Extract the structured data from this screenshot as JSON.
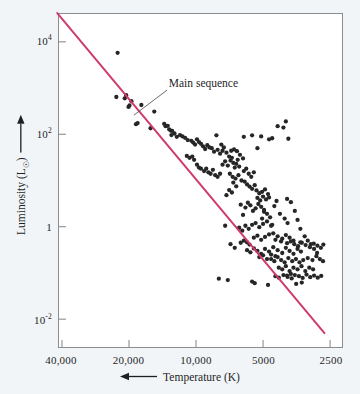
{
  "figure": {
    "background_color": "#f1f5f8",
    "plot_background_color": "#ffffff",
    "frame_color": "#8a8d90"
  },
  "chart_data": {
    "type": "scatter",
    "title": "",
    "xlabel": "Temperature (K)",
    "ylabel": "Luminosity (L☉)",
    "x_scale": "log-reversed",
    "y_scale": "log",
    "xlim": [
      40000,
      2500
    ],
    "ylim": [
      0.0025,
      40000
    ],
    "grid": false,
    "legend": null,
    "xticks": [
      40000,
      20000,
      10000,
      5000,
      2500
    ],
    "xtick_labels": [
      "40,000",
      "20,000",
      "10,000",
      "5000",
      "2500"
    ],
    "yticks": [
      10000,
      100,
      1,
      0.01
    ],
    "ytick_labels_html": [
      "10<sup>4</sup>",
      "10<sup>2</sup>",
      "1",
      "10<sup>-2</sup>"
    ],
    "annotations": [
      {
        "text": "Main sequence",
        "x": 13500,
        "y": 900,
        "leader_to_x": 19000,
        "leader_to_y": 260
      }
    ],
    "series": [
      {
        "name": "main-sequence-fit-line",
        "type": "line",
        "color": "#cf3a6b",
        "linewidth": 2.0,
        "points": [
          [
            42000,
            42000
          ],
          [
            2650,
            0.005
          ]
        ]
      },
      {
        "name": "stars",
        "type": "scatter",
        "color": "#262626",
        "marker": "o",
        "marker_size": 3.4,
        "count": 236,
        "points": [
          [
            22500,
            5800
          ],
          [
            22800,
            640
          ],
          [
            20600,
            700
          ],
          [
            20900,
            600
          ],
          [
            20100,
            390
          ],
          [
            19900,
            420
          ],
          [
            19500,
            520
          ],
          [
            18600,
            165
          ],
          [
            18300,
            175
          ],
          [
            17600,
            430
          ],
          [
            16000,
            135
          ],
          [
            15400,
            310
          ],
          [
            13900,
            168
          ],
          [
            13700,
            150
          ],
          [
            13400,
            152
          ],
          [
            13200,
            128
          ],
          [
            13000,
            120
          ],
          [
            12800,
            118
          ],
          [
            12500,
            104
          ],
          [
            12900,
            96
          ],
          [
            11000,
            34
          ],
          [
            10700,
            31
          ],
          [
            10400,
            33
          ],
          [
            10200,
            28
          ],
          [
            9900,
            22
          ],
          [
            9700,
            19
          ],
          [
            9500,
            18
          ],
          [
            9200,
            16
          ],
          [
            9000,
            18
          ],
          [
            8800,
            15
          ],
          [
            8600,
            14
          ],
          [
            8400,
            17
          ],
          [
            8200,
            13
          ],
          [
            8000,
            12
          ],
          [
            7800,
            14
          ],
          [
            8100,
            95
          ],
          [
            7700,
            60
          ],
          [
            7500,
            52
          ],
          [
            7300,
            40
          ],
          [
            7100,
            33
          ],
          [
            7600,
            22
          ],
          [
            7400,
            26
          ],
          [
            7200,
            21
          ],
          [
            7000,
            27
          ],
          [
            6900,
            31
          ],
          [
            6800,
            24
          ],
          [
            6700,
            19
          ],
          [
            6600,
            23
          ],
          [
            6500,
            28
          ],
          [
            6400,
            20
          ],
          [
            6950,
            44
          ],
          [
            6750,
            47
          ],
          [
            6550,
            43
          ],
          [
            6350,
            36
          ],
          [
            6150,
            30
          ],
          [
            7050,
            14
          ],
          [
            6850,
            12
          ],
          [
            6650,
            11
          ],
          [
            6450,
            13
          ],
          [
            6250,
            10
          ],
          [
            6100,
            16
          ],
          [
            5950,
            18
          ],
          [
            5800,
            14
          ],
          [
            5650,
            12
          ],
          [
            5500,
            15
          ],
          [
            6050,
            9.5
          ],
          [
            5900,
            8.2
          ],
          [
            5750,
            7.4
          ],
          [
            5600,
            6.6
          ],
          [
            5450,
            7.9
          ],
          [
            6300,
            3.0
          ],
          [
            6150,
            1.8
          ],
          [
            6000,
            2.6
          ],
          [
            5850,
            3.3
          ],
          [
            5700,
            2.9
          ],
          [
            5550,
            2.2
          ],
          [
            5400,
            2.5
          ],
          [
            5250,
            3.1
          ],
          [
            5100,
            2.7
          ],
          [
            4950,
            2.3
          ],
          [
            5350,
            6.1
          ],
          [
            5200,
            5.3
          ],
          [
            5050,
            5.7
          ],
          [
            4900,
            6.4
          ],
          [
            4750,
            5.1
          ],
          [
            5300,
            4.2
          ],
          [
            5150,
            3.7
          ],
          [
            5000,
            4.5
          ],
          [
            4850,
            3.9
          ],
          [
            4700,
            4.3
          ],
          [
            6400,
            0.95
          ],
          [
            6200,
            0.82
          ],
          [
            6000,
            1.05
          ],
          [
            5800,
            0.9
          ],
          [
            5600,
            1.1
          ],
          [
            5400,
            1.2
          ],
          [
            5200,
            0.98
          ],
          [
            5000,
            1.15
          ],
          [
            4800,
            1.3
          ],
          [
            4600,
            1.05
          ],
          [
            5500,
            0.58
          ],
          [
            5300,
            0.64
          ],
          [
            5100,
            0.52
          ],
          [
            4900,
            0.6
          ],
          [
            4700,
            0.68
          ],
          [
            4500,
            0.72
          ],
          [
            4300,
            0.62
          ],
          [
            4100,
            0.55
          ],
          [
            3950,
            0.66
          ],
          [
            3800,
            0.58
          ],
          [
            5900,
            0.31
          ],
          [
            5700,
            0.28
          ],
          [
            5500,
            0.34
          ],
          [
            5300,
            0.3
          ],
          [
            5100,
            0.26
          ],
          [
            4900,
            0.33
          ],
          [
            4700,
            0.29
          ],
          [
            4500,
            0.36
          ],
          [
            4300,
            0.31
          ],
          [
            4100,
            0.27
          ],
          [
            3950,
            0.35
          ],
          [
            3800,
            0.3
          ],
          [
            3650,
            0.26
          ],
          [
            3500,
            0.33
          ],
          [
            3380,
            0.29
          ],
          [
            4600,
            0.2
          ],
          [
            4450,
            0.18
          ],
          [
            4300,
            0.22
          ],
          [
            4150,
            0.19
          ],
          [
            4000,
            0.17
          ],
          [
            3850,
            0.21
          ],
          [
            3700,
            0.18
          ],
          [
            3560,
            0.2
          ],
          [
            3430,
            0.17
          ],
          [
            3300,
            0.19
          ],
          [
            4250,
            0.13
          ],
          [
            4100,
            0.12
          ],
          [
            3950,
            0.14
          ],
          [
            3800,
            0.11
          ],
          [
            3650,
            0.13
          ],
          [
            3500,
            0.12
          ],
          [
            3360,
            0.14
          ],
          [
            3230,
            0.11
          ],
          [
            3100,
            0.13
          ],
          [
            2980,
            0.12
          ],
          [
            3450,
            0.085
          ],
          [
            3320,
            0.078
          ],
          [
            3190,
            0.092
          ],
          [
            3070,
            0.081
          ],
          [
            2950,
            0.088
          ],
          [
            2840,
            0.079
          ],
          [
            2740,
            0.086
          ],
          [
            3600,
            0.09
          ],
          [
            3750,
            0.095
          ],
          [
            3900,
            0.088
          ],
          [
            4400,
            0.085
          ],
          [
            4250,
            0.079
          ],
          [
            4050,
            0.09
          ],
          [
            3880,
            0.082
          ],
          [
            3720,
            0.076
          ],
          [
            7400,
            1.05
          ],
          [
            7000,
            0.42
          ],
          [
            6700,
            0.35
          ],
          [
            7900,
            0.075
          ],
          [
            7200,
            0.07
          ],
          [
            5600,
            0.065
          ],
          [
            6300,
            0.45
          ],
          [
            6100,
            0.5
          ],
          [
            5900,
            0.46
          ],
          [
            5750,
            0.41
          ],
          [
            3900,
            4.0
          ],
          [
            3750,
            3.4
          ],
          [
            3600,
            2.2
          ],
          [
            3500,
            1.4
          ],
          [
            3400,
            0.9
          ],
          [
            3250,
            0.62
          ],
          [
            3150,
            0.5
          ],
          [
            3050,
            0.42
          ],
          [
            2950,
            0.33
          ],
          [
            2860,
            0.27
          ],
          [
            4550,
            82
          ],
          [
            4300,
            150
          ],
          [
            4050,
            140
          ],
          [
            3950,
            190
          ],
          [
            3850,
            80
          ],
          [
            4700,
            78
          ],
          [
            5100,
            90
          ],
          [
            5600,
            95
          ],
          [
            6100,
            88
          ],
          [
            5300,
            50
          ],
          [
            4450,
            2.8
          ],
          [
            4350,
            3.6
          ],
          [
            4200,
            1.9
          ],
          [
            4000,
            1.5
          ],
          [
            3880,
            1.2
          ],
          [
            4650,
            1.6
          ],
          [
            4800,
            1.9
          ],
          [
            4950,
            2.1
          ],
          [
            5050,
            1.5
          ],
          [
            4550,
            1.1
          ],
          [
            3750,
            0.48
          ],
          [
            3620,
            0.42
          ],
          [
            3480,
            0.38
          ],
          [
            3350,
            0.45
          ],
          [
            3220,
            0.4
          ],
          [
            3080,
            0.36
          ],
          [
            2960,
            0.43
          ],
          [
            2850,
            0.39
          ],
          [
            2750,
            0.35
          ],
          [
            2680,
            0.41
          ],
          [
            6800,
            9.0
          ],
          [
            6600,
            7.5
          ],
          [
            6900,
            5.5
          ],
          [
            7100,
            6.2
          ],
          [
            7300,
            4.8
          ],
          [
            8300,
            42
          ],
          [
            8500,
            50
          ],
          [
            8000,
            46
          ],
          [
            7800,
            38
          ],
          [
            7600,
            44
          ],
          [
            9300,
            55
          ],
          [
            9100,
            48
          ],
          [
            8900,
            58
          ],
          [
            8700,
            52
          ],
          [
            9500,
            62
          ],
          [
            10500,
            72
          ],
          [
            10300,
            66
          ],
          [
            10100,
            60
          ],
          [
            9900,
            78
          ],
          [
            9700,
            68
          ],
          [
            11500,
            90
          ],
          [
            11200,
            84
          ],
          [
            10900,
            75
          ],
          [
            11800,
            96
          ],
          [
            12200,
            88
          ],
          [
            4400,
            0.52
          ],
          [
            4150,
            0.48
          ],
          [
            3900,
            0.44
          ],
          [
            3650,
            0.5
          ],
          [
            3400,
            0.46
          ],
          [
            5200,
            0.22
          ],
          [
            5000,
            0.24
          ],
          [
            4800,
            0.2
          ],
          [
            4600,
            0.25
          ],
          [
            4400,
            0.23
          ],
          [
            3150,
            0.21
          ],
          [
            3000,
            0.19
          ],
          [
            2880,
            0.23
          ],
          [
            2780,
            0.2
          ],
          [
            2690,
            0.18
          ],
          [
            3550,
            0.058
          ],
          [
            3350,
            0.062
          ],
          [
            4750,
            0.055
          ],
          [
            5450,
            0.06
          ]
        ]
      }
    ]
  }
}
